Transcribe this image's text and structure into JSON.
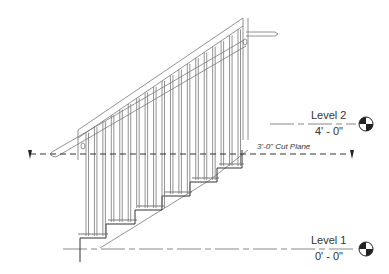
{
  "diagram": {
    "type": "stair-section-elevation",
    "stroke_color": "#6a6a6a",
    "dark_stroke_color": "#222222",
    "background": "#ffffff"
  },
  "levels": [
    {
      "name": "Level 2",
      "elevation": "4' - 0\"",
      "y": 124
    },
    {
      "name": "Level 1",
      "elevation": "0' - 0\"",
      "y": 249
    }
  ],
  "cut_plane": {
    "label": "3'-0\" Cut Plane",
    "y": 154
  },
  "stair": {
    "risers": 6,
    "balusters": 19
  }
}
